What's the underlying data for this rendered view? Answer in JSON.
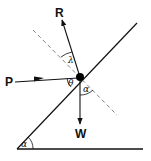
{
  "diagram": {
    "title": "",
    "labels": {
      "reaction": "R",
      "push": "P",
      "weight": "W",
      "theta": "θ",
      "alpha_at_ball": "α",
      "lambda": "λ",
      "alpha_at_base": "α"
    },
    "colors": {
      "line": "#111111",
      "dashed": "#777777",
      "ball": "#000000"
    },
    "elements": [
      {
        "name": "incline",
        "type": "line"
      },
      {
        "name": "ground",
        "type": "line"
      },
      {
        "name": "normal",
        "type": "dashed-line"
      },
      {
        "name": "force-R",
        "type": "arrow"
      },
      {
        "name": "force-P",
        "type": "arrow"
      },
      {
        "name": "force-W",
        "type": "arrow"
      },
      {
        "name": "body",
        "type": "point-mass"
      }
    ]
  }
}
